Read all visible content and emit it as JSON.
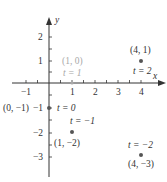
{
  "axes": {
    "x_label": "x",
    "y_label": "y",
    "x_ticks": [
      {
        "value": -1,
        "label": "−1"
      },
      {
        "value": 1,
        "label": "1"
      },
      {
        "value": 2,
        "label": "2"
      },
      {
        "value": 3,
        "label": "3"
      },
      {
        "value": 4,
        "label": "4"
      }
    ],
    "y_ticks": [
      {
        "value": 2,
        "label": "2"
      },
      {
        "value": 1,
        "label": "1"
      },
      {
        "value": -1,
        "label": "−1"
      },
      {
        "value": -2,
        "label": "−2"
      },
      {
        "value": -3,
        "label": "−3"
      }
    ],
    "axis_color": "#333333"
  },
  "points": [
    {
      "x": 4,
      "y": 1,
      "coord_label": "(4, 1)",
      "t_label": "t = 2",
      "muted": false
    },
    {
      "x": 1,
      "y": 0,
      "coord_label": "(1, 0)",
      "t_label": "t = 1",
      "muted": true
    },
    {
      "x": 0,
      "y": -1,
      "coord_label": "(0, −1)",
      "t_label": "t = 0",
      "muted": false
    },
    {
      "x": 1,
      "y": -2,
      "coord_label": "(1, −2)",
      "t_label": "t = −1",
      "muted": false
    },
    {
      "x": 4,
      "y": -3,
      "coord_label": "(4, −3)",
      "t_label": "t = −2",
      "muted": false
    }
  ],
  "colors": {
    "point": "#555555",
    "text": "#333333",
    "muted_text": "#a8a8a8"
  }
}
